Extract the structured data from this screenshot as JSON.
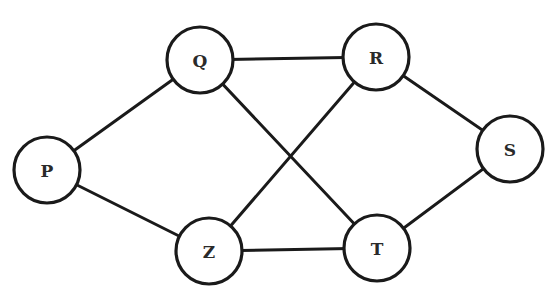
{
  "diagram": {
    "type": "undirected-graph",
    "colors": {
      "stroke": "#1a1a1a",
      "fill": "#ffffff",
      "label": "#2a2a2a"
    },
    "node_radius": 33,
    "nodes": [
      {
        "id": "P",
        "label": "P",
        "x": 47,
        "y": 170
      },
      {
        "id": "Q",
        "label": "Q",
        "x": 200,
        "y": 60
      },
      {
        "id": "R",
        "label": "R",
        "x": 376,
        "y": 57
      },
      {
        "id": "S",
        "label": "S",
        "x": 510,
        "y": 149
      },
      {
        "id": "Z",
        "label": "Z",
        "x": 209,
        "y": 251
      },
      {
        "id": "T",
        "label": "T",
        "x": 377,
        "y": 248
      }
    ],
    "edges": [
      {
        "from": "P",
        "to": "Q"
      },
      {
        "from": "P",
        "to": "Z"
      },
      {
        "from": "Q",
        "to": "R"
      },
      {
        "from": "Q",
        "to": "T"
      },
      {
        "from": "R",
        "to": "Z"
      },
      {
        "from": "R",
        "to": "S"
      },
      {
        "from": "Z",
        "to": "T"
      },
      {
        "from": "T",
        "to": "S"
      }
    ]
  }
}
